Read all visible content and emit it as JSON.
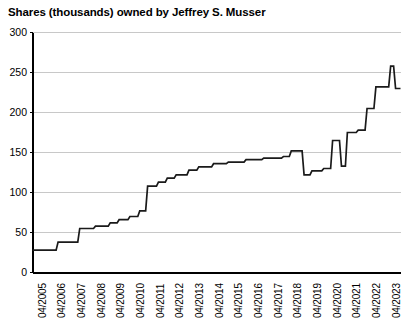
{
  "chart_data": {
    "type": "line",
    "title": "Shares (thousands) owned by Jeffrey S. Musser",
    "xlabel": "",
    "ylabel": "",
    "grid": true,
    "legend": "none",
    "line_style": "step-post",
    "line_color": "#1a1a1a",
    "grid_color": "#c8c8c8",
    "axis_color": "#000000",
    "background": "#ffffff",
    "ylim": [
      0,
      300
    ],
    "yticks": [
      0,
      50,
      100,
      150,
      200,
      250,
      300
    ],
    "ytick_labels": [
      "0",
      "50",
      "100",
      "150",
      "200",
      "250",
      "300"
    ],
    "xtick_labels": [
      "04/2005",
      "04/2006",
      "04/2007",
      "04/2008",
      "04/2009",
      "04/2010",
      "04/2011",
      "04/2012",
      "04/2013",
      "04/2014",
      "04/2015",
      "04/2016",
      "04/2017",
      "04/2018",
      "04/2019",
      "04/2020",
      "04/2021",
      "04/2022",
      "04/2023"
    ],
    "xlim": [
      2005.25,
      2023.95
    ],
    "x": [
      2005.25,
      2006.25,
      2006.55,
      2007.3,
      2007.75,
      2008.3,
      2008.75,
      2009.3,
      2009.8,
      2010.3,
      2010.8,
      2011.05,
      2011.35,
      2011.8,
      2012.1,
      2012.45,
      2012.8,
      2013.2,
      2013.6,
      2014.0,
      2014.5,
      2015.0,
      2015.5,
      2016.0,
      2016.6,
      2017.2,
      2017.85,
      2018.2,
      2018.45,
      2018.7,
      2018.95,
      2019.3,
      2019.65,
      2019.95,
      2020.25,
      2020.5,
      2020.8,
      2021.0,
      2021.3,
      2021.6,
      2021.9,
      2022.2,
      2022.5,
      2022.8,
      2023.15,
      2023.4,
      2023.6,
      2023.95
    ],
    "values": [
      28,
      28,
      38,
      38,
      55,
      55,
      62,
      62,
      70,
      70,
      77,
      77,
      108,
      108,
      118,
      118,
      122,
      122,
      132,
      132,
      138,
      138,
      140,
      140,
      143,
      143,
      145,
      145,
      148,
      148,
      152,
      152,
      122,
      122,
      128,
      128,
      132,
      132,
      165,
      165,
      133,
      133,
      175,
      175,
      200,
      200,
      232,
      232
    ],
    "series": [
      {
        "name": "Shares owned",
        "points": [
          {
            "x": 2005.25,
            "y": 28
          },
          {
            "x": 2006.45,
            "y": 28
          },
          {
            "x": 2006.55,
            "y": 38
          },
          {
            "x": 2007.55,
            "y": 38
          },
          {
            "x": 2007.65,
            "y": 55
          },
          {
            "x": 2008.35,
            "y": 55
          },
          {
            "x": 2008.45,
            "y": 58
          },
          {
            "x": 2009.1,
            "y": 58
          },
          {
            "x": 2009.2,
            "y": 62
          },
          {
            "x": 2009.55,
            "y": 62
          },
          {
            "x": 2009.65,
            "y": 66
          },
          {
            "x": 2010.1,
            "y": 66
          },
          {
            "x": 2010.2,
            "y": 70
          },
          {
            "x": 2010.6,
            "y": 70
          },
          {
            "x": 2010.7,
            "y": 77
          },
          {
            "x": 2011.0,
            "y": 77
          },
          {
            "x": 2011.1,
            "y": 108
          },
          {
            "x": 2011.55,
            "y": 108
          },
          {
            "x": 2011.65,
            "y": 113
          },
          {
            "x": 2012.0,
            "y": 113
          },
          {
            "x": 2012.1,
            "y": 118
          },
          {
            "x": 2012.45,
            "y": 118
          },
          {
            "x": 2012.55,
            "y": 122
          },
          {
            "x": 2013.1,
            "y": 122
          },
          {
            "x": 2013.2,
            "y": 128
          },
          {
            "x": 2013.6,
            "y": 128
          },
          {
            "x": 2013.7,
            "y": 132
          },
          {
            "x": 2014.35,
            "y": 132
          },
          {
            "x": 2014.45,
            "y": 136
          },
          {
            "x": 2015.1,
            "y": 136
          },
          {
            "x": 2015.2,
            "y": 138
          },
          {
            "x": 2016.0,
            "y": 138
          },
          {
            "x": 2016.1,
            "y": 141
          },
          {
            "x": 2016.9,
            "y": 141
          },
          {
            "x": 2017.0,
            "y": 143
          },
          {
            "x": 2017.9,
            "y": 143
          },
          {
            "x": 2018.0,
            "y": 145
          },
          {
            "x": 2018.3,
            "y": 145
          },
          {
            "x": 2018.4,
            "y": 152
          },
          {
            "x": 2018.95,
            "y": 152
          },
          {
            "x": 2019.05,
            "y": 122
          },
          {
            "x": 2019.35,
            "y": 122
          },
          {
            "x": 2019.45,
            "y": 127
          },
          {
            "x": 2019.95,
            "y": 127
          },
          {
            "x": 2020.05,
            "y": 130
          },
          {
            "x": 2020.4,
            "y": 130
          },
          {
            "x": 2020.5,
            "y": 165
          },
          {
            "x": 2020.85,
            "y": 165
          },
          {
            "x": 2020.95,
            "y": 133
          },
          {
            "x": 2021.15,
            "y": 133
          },
          {
            "x": 2021.25,
            "y": 175
          },
          {
            "x": 2021.7,
            "y": 175
          },
          {
            "x": 2021.8,
            "y": 178
          },
          {
            "x": 2022.15,
            "y": 178
          },
          {
            "x": 2022.25,
            "y": 205
          },
          {
            "x": 2022.6,
            "y": 205
          },
          {
            "x": 2022.7,
            "y": 232
          },
          {
            "x": 2023.35,
            "y": 232
          },
          {
            "x": 2023.45,
            "y": 258
          },
          {
            "x": 2023.6,
            "y": 258
          },
          {
            "x": 2023.7,
            "y": 230
          },
          {
            "x": 2023.95,
            "y": 230
          }
        ]
      }
    ]
  }
}
